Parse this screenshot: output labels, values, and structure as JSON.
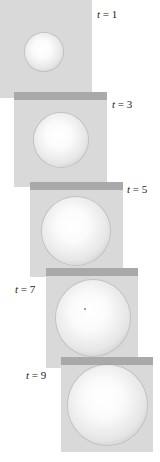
{
  "figure": {
    "panels": [
      {
        "label_var": "t",
        "label_eq": " = ",
        "label_val": "1"
      },
      {
        "label_var": "t",
        "label_eq": " = ",
        "label_val": "3"
      },
      {
        "label_var": "t",
        "label_eq": " = ",
        "label_val": "5"
      },
      {
        "label_var": "t",
        "label_eq": " = ",
        "label_val": "7"
      },
      {
        "label_var": "t",
        "label_eq": " = ",
        "label_val": "9"
      }
    ]
  },
  "colors": {
    "panel_bg": "#d9d9d9",
    "band": "#a9a9a9",
    "sphere_highlight": "#ffffff",
    "sphere_edge": "#a8a8a8"
  }
}
